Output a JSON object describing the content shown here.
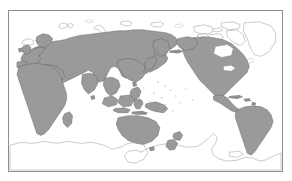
{
  "figure": {
    "type": "world-map",
    "projection": "pacific-centered-equirectangular",
    "title": "",
    "caption": "",
    "frame": {
      "visible": true,
      "border_color": "#8d8d8d",
      "background_color": "#ffffff",
      "x": 8,
      "y": 10,
      "width": 275,
      "height": 162
    },
    "legend": {
      "visible": false,
      "entries": []
    },
    "graticule": {
      "visible": false
    },
    "labels": []
  },
  "colors": {
    "shaded_fill": "#9a9a9a",
    "shaded_stroke": "#5e5e5e",
    "outline_fill": "#ffffff",
    "outline_stroke": "#8a8a8a",
    "page_background": "#ffffff"
  },
  "regions": {
    "shaded": [
      {
        "name": "eurasia",
        "label": "Eurasia"
      },
      {
        "name": "africa",
        "label": "Africa"
      },
      {
        "name": "madagascar",
        "label": "Madagascar"
      },
      {
        "name": "japan",
        "label": "Japan"
      },
      {
        "name": "philippines",
        "label": "Philippines"
      },
      {
        "name": "indonesia",
        "label": "Indonesia"
      },
      {
        "name": "new-guinea",
        "label": "New Guinea"
      },
      {
        "name": "australia",
        "label": "Australia"
      },
      {
        "name": "new-zealand",
        "label": "New Zealand"
      },
      {
        "name": "sri-lanka",
        "label": "Sri Lanka"
      },
      {
        "name": "taiwan",
        "label": "Taiwan"
      },
      {
        "name": "british-isles",
        "label": "British Isles"
      },
      {
        "name": "north-america",
        "label": "North America"
      },
      {
        "name": "central-america",
        "label": "Central America"
      },
      {
        "name": "caribbean",
        "label": "Caribbean"
      },
      {
        "name": "south-america",
        "label": "South America"
      }
    ],
    "unshaded": [
      {
        "name": "greenland",
        "label": "Greenland"
      },
      {
        "name": "arctic-canada",
        "label": "Canadian Arctic Archipelago"
      },
      {
        "name": "iceland",
        "label": "Iceland"
      },
      {
        "name": "svalbard",
        "label": "Svalbard"
      },
      {
        "name": "novaya-zemlya",
        "label": "Novaya Zemlya"
      },
      {
        "name": "severnaya-zemlya",
        "label": "Severnaya Zemlya"
      },
      {
        "name": "new-siberian-islands",
        "label": "New Siberian Islands"
      },
      {
        "name": "antarctica",
        "label": "Antarctica"
      },
      {
        "name": "pacific-islands",
        "label": "Pacific Islands"
      }
    ]
  }
}
